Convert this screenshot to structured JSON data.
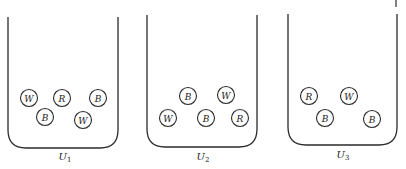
{
  "diagram": {
    "ball_colors_legend": {
      "W": "white",
      "R": "red",
      "B": "black"
    },
    "urns": [
      {
        "label": "U",
        "subscript": "1",
        "left": 8,
        "right": 118,
        "top": 17,
        "bottom": 148,
        "label_x": 65,
        "label_y": 160,
        "balls": [
          {
            "letter": "W",
            "x": 29,
            "y": 98
          },
          {
            "letter": "R",
            "x": 62,
            "y": 98
          },
          {
            "letter": "B",
            "x": 98,
            "y": 98
          },
          {
            "letter": "B",
            "x": 45,
            "y": 117
          },
          {
            "letter": "W",
            "x": 83,
            "y": 120
          }
        ]
      },
      {
        "label": "U",
        "subscript": "2",
        "left": 147,
        "right": 257,
        "top": 15,
        "bottom": 147,
        "label_x": 203,
        "label_y": 160,
        "balls": [
          {
            "letter": "B",
            "x": 188,
            "y": 96
          },
          {
            "letter": "W",
            "x": 226,
            "y": 95
          },
          {
            "letter": "W",
            "x": 168,
            "y": 118
          },
          {
            "letter": "B",
            "x": 206,
            "y": 118
          },
          {
            "letter": "R",
            "x": 240,
            "y": 118
          }
        ]
      },
      {
        "label": "U",
        "subscript": "3",
        "left": 288,
        "right": 397,
        "top": 14,
        "bottom": 145,
        "label_x": 343,
        "label_y": 158,
        "balls": [
          {
            "letter": "R",
            "x": 309,
            "y": 96
          },
          {
            "letter": "W",
            "x": 349,
            "y": 96
          },
          {
            "letter": "B",
            "x": 325,
            "y": 118
          },
          {
            "letter": "B",
            "x": 372,
            "y": 119
          }
        ]
      }
    ],
    "ball_radius": 8.5,
    "corner_radius": 18
  }
}
